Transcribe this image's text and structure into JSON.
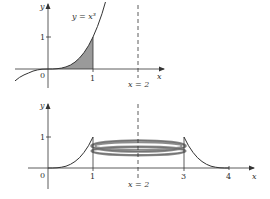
{
  "top_panel": {
    "function_label": "y = x³",
    "y_axis_label": "y",
    "x_axis_label": "x",
    "origin_label": "0",
    "x_tick_labels": [
      "1"
    ],
    "y_tick_labels": [
      "1"
    ],
    "line_label": "x = 2",
    "shaded_region": "area under y = x³ from x = 0 to x = 1"
  },
  "bottom_panel": {
    "y_axis_label": "y",
    "x_axis_label": "x",
    "origin_label": "0",
    "x_tick_labels": [
      "1",
      "3",
      "4"
    ],
    "y_tick_labels": [
      "1"
    ],
    "line_label": "x = 2",
    "description": "region rotated about the line x = 2 forming a washer-shaped solid"
  },
  "colors": {
    "ink": "#333333",
    "shade": "#9a9a9a",
    "ring": "#8c8c8c"
  }
}
